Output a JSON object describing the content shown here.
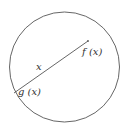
{
  "diagram": {
    "shape": "circle",
    "chord": {
      "label": "x",
      "endpoints": {
        "upper": "f (x)",
        "lower": "g (x)"
      }
    },
    "colors": {
      "stroke": "#555555",
      "text": "#333333",
      "background": "#ffffff"
    }
  }
}
